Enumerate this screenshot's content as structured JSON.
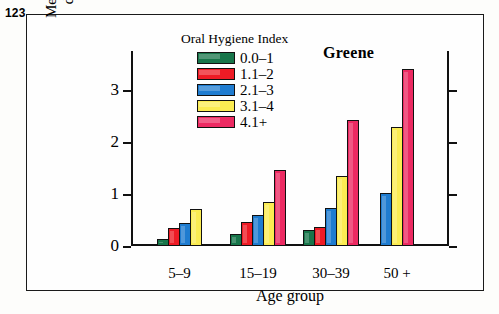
{
  "page_number": "123",
  "chart_data": {
    "type": "bar",
    "title": "Greene",
    "xlabel": "Age group",
    "ylabel_line1": "Mean periodontal",
    "ylabel_line2": "disease score",
    "legend_title": "Oral Hygiene Index",
    "legend_position": "top-center-inside",
    "grid": false,
    "ylim": [
      0,
      3.75
    ],
    "yticks": [
      0,
      1,
      2,
      3
    ],
    "ytick_labels": [
      "0",
      "1",
      "2",
      "3"
    ],
    "categories": [
      "5–9",
      "15–19",
      "30–39",
      "50 +"
    ],
    "series": [
      {
        "name": "0.0–1",
        "color": "#17754a",
        "values": [
          0.13,
          0.23,
          0.31,
          null
        ]
      },
      {
        "name": "1.1–2",
        "color": "#ee1b25",
        "values": [
          0.35,
          0.46,
          0.37,
          null
        ]
      },
      {
        "name": "2.1–3",
        "color": "#1f7cd0",
        "values": [
          0.45,
          0.6,
          0.73,
          1.02
        ]
      },
      {
        "name": "3.1–4",
        "color": "#fbec52",
        "values": [
          0.71,
          0.85,
          1.35,
          2.28
        ]
      },
      {
        "name": "4.1+",
        "color": "#ec2a62",
        "values": [
          null,
          1.47,
          2.42,
          3.4
        ]
      }
    ]
  }
}
